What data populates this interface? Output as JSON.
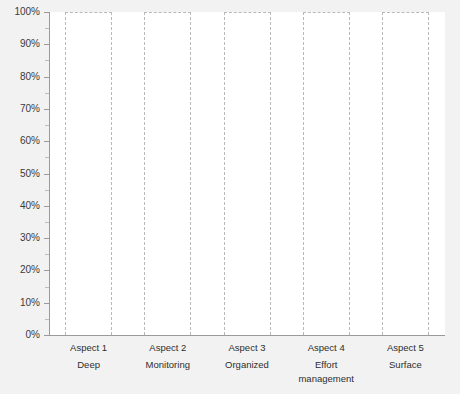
{
  "chart_data": {
    "type": "box",
    "title": "",
    "subtitle": "",
    "xlabel": "",
    "ylabel": "",
    "ylim": [
      0,
      100
    ],
    "y_unit": "%",
    "grid": false,
    "legend": "none",
    "y_ticks": [
      "0%",
      "10%",
      "20%",
      "30%",
      "40%",
      "50%",
      "60%",
      "70%",
      "80%",
      "90%",
      "100%"
    ],
    "y_tick_values": [
      0,
      10,
      20,
      30,
      40,
      50,
      60,
      70,
      80,
      90,
      100
    ],
    "y_minor_tick_values": [
      5,
      15,
      25,
      35,
      45,
      55,
      65,
      75,
      85,
      95
    ],
    "categories": [
      {
        "id": "aspect-1",
        "name": "Aspect 1",
        "desc": "Deep"
      },
      {
        "id": "aspect-2",
        "name": "Aspect 2",
        "desc": "Monitoring"
      },
      {
        "id": "aspect-3",
        "name": "Aspect 3",
        "desc": "Organized"
      },
      {
        "id": "aspect-4",
        "name": "Aspect 4",
        "desc": "Effort management"
      },
      {
        "id": "aspect-5",
        "name": "Aspect 5",
        "desc": "Surface"
      }
    ],
    "series": [
      {
        "name": "Range",
        "values": [
          {
            "category": "Aspect 1",
            "min": 0,
            "max": 100
          },
          {
            "category": "Aspect 2",
            "min": 0,
            "max": 100
          },
          {
            "category": "Aspect 3",
            "min": 0,
            "max": 100
          },
          {
            "category": "Aspect 4",
            "min": 0,
            "max": 100
          },
          {
            "category": "Aspect 5",
            "min": 0,
            "max": 100
          }
        ]
      }
    ],
    "colors": {
      "canvas": "#f2f2f2",
      "plot_background": "#ffffff",
      "axis": "#9a9a9a",
      "box_outline": "#b9b9b9",
      "tick_label": "#3a3a3a",
      "category_label": "#2e2e2e"
    }
  }
}
